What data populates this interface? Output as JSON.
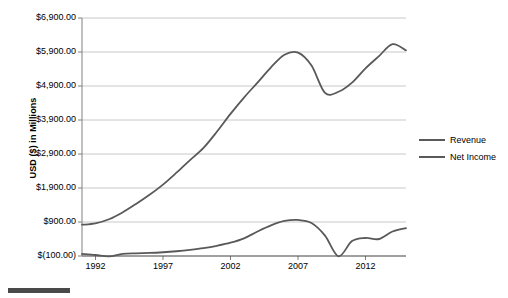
{
  "chart_data": {
    "type": "line",
    "title": "",
    "xlabel": "",
    "ylabel": "USD ($) in Millions",
    "xlim": [
      1991,
      2015
    ],
    "ylim": [
      -100,
      6900
    ],
    "grid": true,
    "legend_position": "right",
    "y_tick_labels": [
      "$6,900.00",
      "$5,900.00",
      "$4,900.00",
      "$3,900.00",
      "$2,900.00",
      "$1,900.00",
      "$900.00",
      "$(100.00)"
    ],
    "y_tick_values": [
      6900,
      5900,
      4900,
      3900,
      2900,
      1900,
      900,
      -100
    ],
    "x_tick_labels": [
      "1992",
      "1997",
      "2002",
      "2007",
      "2012"
    ],
    "x_tick_values": [
      1992,
      1997,
      2002,
      2007,
      2012
    ],
    "x": [
      1991,
      1992,
      1993,
      1994,
      1995,
      1996,
      1997,
      1998,
      1999,
      2000,
      2001,
      2002,
      2003,
      2004,
      2005,
      2006,
      2007,
      2008,
      2009,
      2010,
      2011,
      2012,
      2013,
      2014,
      2015
    ],
    "series": [
      {
        "name": "Revenue",
        "color": "#595959",
        "values": [
          820,
          860,
          980,
          1180,
          1430,
          1700,
          2000,
          2350,
          2720,
          3080,
          3560,
          4080,
          4560,
          5000,
          5450,
          5820,
          5880,
          5500,
          4700,
          4730,
          5000,
          5420,
          5780,
          6130,
          5950
        ]
      },
      {
        "name": "Net Income",
        "color": "#595959",
        "values": [
          -40,
          -70,
          -110,
          -40,
          -20,
          -10,
          10,
          40,
          80,
          130,
          200,
          290,
          420,
          620,
          800,
          930,
          960,
          870,
          500,
          -110,
          340,
          430,
          400,
          620,
          720
        ]
      }
    ]
  },
  "legend": {
    "items": [
      {
        "label": "Revenue"
      },
      {
        "label": "Net Income"
      }
    ]
  },
  "axes": {
    "y_title": "USD ($) in Millions"
  }
}
